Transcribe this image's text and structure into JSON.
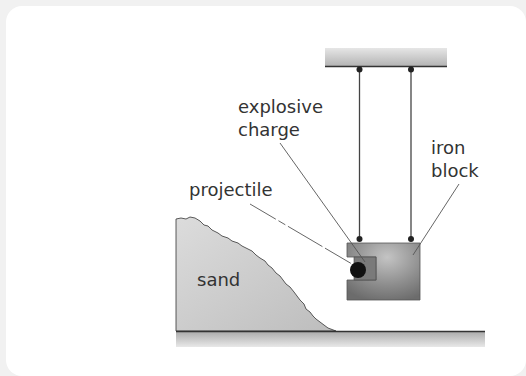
{
  "diagram": {
    "labels": {
      "explosive_line1": "explosive",
      "explosive_line2": "charge",
      "iron_line1": "iron",
      "iron_line2": "block",
      "projectile": "projectile",
      "sand": "sand"
    },
    "colors": {
      "background": "#ffffff",
      "page": "#f1f1f1",
      "ceiling": "#c8c8c8",
      "block": "#8a8a8a",
      "sand": "#d0d0d0",
      "line": "#333333",
      "projectile": "#111111"
    }
  }
}
